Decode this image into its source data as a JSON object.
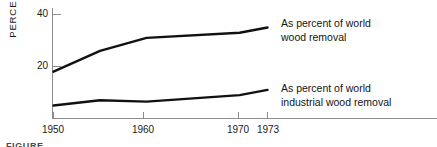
{
  "chart_data": {
    "type": "line",
    "title": "",
    "subtitle": "",
    "xlabel": "",
    "ylabel": "PERCENT",
    "x": [
      1950,
      1955,
      1960,
      1970,
      1973
    ],
    "xlim": [
      1950,
      1973
    ],
    "ylim": [
      0,
      44
    ],
    "yticks": [
      20,
      40
    ],
    "ytick_labels": [
      "20",
      "40"
    ],
    "xticks": [
      1950,
      1960,
      1970,
      1973
    ],
    "xtick_labels": [
      "1950",
      "1960",
      "1970",
      "1973"
    ],
    "grid": false,
    "legend_position": "right-inline-annotations",
    "series": [
      {
        "name": "As percent of world wood removal",
        "values": [
          18,
          26,
          31,
          33,
          35
        ],
        "color": "#111111"
      },
      {
        "name": "As percent of world industrial wood removal",
        "values": [
          5,
          7,
          6.5,
          9,
          11
        ],
        "color": "#111111"
      }
    ],
    "annotations": [
      {
        "id": "upper-series-label",
        "line1": "As percent of world",
        "line2": "wood removal"
      },
      {
        "id": "lower-series-label",
        "line1": "As percent of world",
        "line2": "industrial wood removal"
      }
    ]
  },
  "axis": {
    "y_title": "PERCENT",
    "y_tick_40": "40",
    "y_tick_20": "20",
    "x_tick_1950": "1950",
    "x_tick_1960": "1960",
    "x_tick_1970": "1970",
    "x_tick_1973": "1973"
  },
  "labels": {
    "upper_line_1": "As percent of world",
    "upper_line_2": "wood removal",
    "lower_line_1": "As percent of world",
    "lower_line_2": "industrial wood removal"
  },
  "footer": {
    "clipped_caption": "FIGURE"
  },
  "colors": {
    "series_stroke": "#111111",
    "axis_stroke": "#8c8c8c",
    "text": "#1a1a1a",
    "background": "#ffffff"
  }
}
